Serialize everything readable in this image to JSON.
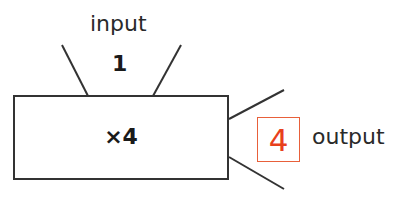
{
  "diagram": {
    "type": "function-machine",
    "input": {
      "label": "input",
      "value": "1"
    },
    "machine": {
      "operation": "×4"
    },
    "output": {
      "label": "output",
      "value": "4"
    },
    "colors": {
      "line": "#333333",
      "output_value": "#e8401c",
      "output_box_border": "#e8603a",
      "text": "#2a2a2a"
    }
  }
}
